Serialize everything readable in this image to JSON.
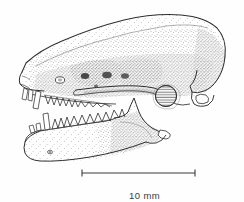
{
  "figure": {
    "kind": "scientific-illustration",
    "title": "",
    "caption": "",
    "background_color": "#fefefe",
    "ink_color": "#2e2e2e",
    "stipple_color": "#555555"
  },
  "scale_bar": {
    "label": "10 mm",
    "value": 10,
    "unit": "mm",
    "x_start": 82,
    "x_end": 195,
    "y": 173,
    "tick_height": 7,
    "line_color": "#3a3a3a"
  },
  "anatomy": {
    "parts": [
      {
        "name": "cranium-braincase",
        "label": "braincase"
      },
      {
        "name": "rostrum",
        "label": "rostrum"
      },
      {
        "name": "zygomatic-arch",
        "label": "zygomatic arch"
      },
      {
        "name": "auditory-bulla",
        "label": "auditory bulla"
      },
      {
        "name": "occipital-region",
        "label": "occipital region"
      },
      {
        "name": "mandible",
        "label": "mandible"
      },
      {
        "name": "coronoid-process",
        "label": "coronoid process"
      },
      {
        "name": "upper-tooth-row",
        "label": "upper tooth row"
      },
      {
        "name": "lower-tooth-row",
        "label": "lower tooth row"
      },
      {
        "name": "orbit",
        "label": "orbit"
      }
    ]
  }
}
